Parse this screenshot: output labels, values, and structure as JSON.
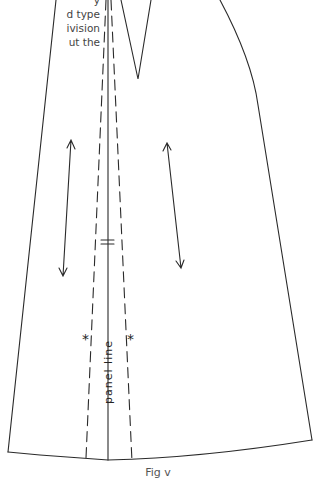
{
  "intro_text": {
    "lines": [
      "y",
      "d type",
      "ivision",
      "ut the"
    ]
  },
  "diagram": {
    "panel_line_label": "panel line",
    "notch_marks": "=",
    "match_marks": [
      "*",
      "*"
    ],
    "colors": {
      "stroke": "#2a2a2a",
      "text": "#444444"
    }
  },
  "caption": "Fig v"
}
